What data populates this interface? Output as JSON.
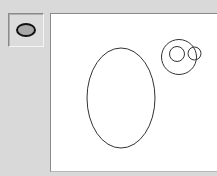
{
  "toolbar": {
    "tools": [
      {
        "name": "ellipse-tool",
        "icon": "ellipse-icon",
        "selected": true,
        "icon_fill": "#a8a8a8",
        "icon_stroke": "#111111"
      }
    ]
  },
  "canvas": {
    "background": "#ffffff",
    "stroke": "#333333",
    "shapes": [
      {
        "type": "ellipse",
        "cx": 121,
        "cy": 98,
        "rx": 34,
        "ry": 50
      },
      {
        "type": "circle",
        "cx": 179,
        "cy": 57,
        "r": 17.5
      },
      {
        "type": "circle",
        "cx": 177,
        "cy": 54,
        "r": 7.5
      },
      {
        "type": "circle",
        "cx": 194.5,
        "cy": 53.5,
        "r": 6.5
      }
    ]
  }
}
